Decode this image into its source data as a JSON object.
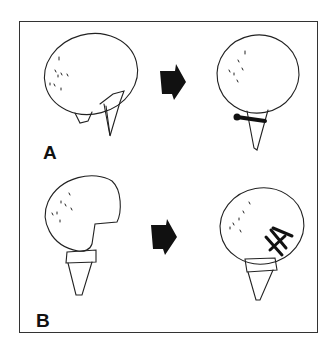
{
  "figure": {
    "panels": [
      {
        "label": "A",
        "description": "Humeral head with fracture, fixed with transverse screw"
      },
      {
        "label": "B",
        "description": "Humeral head with defect, fixed with multiple crossing pins"
      }
    ],
    "colors": {
      "line": "#222222",
      "arrow": "#111111",
      "frame": "#333333"
    }
  }
}
